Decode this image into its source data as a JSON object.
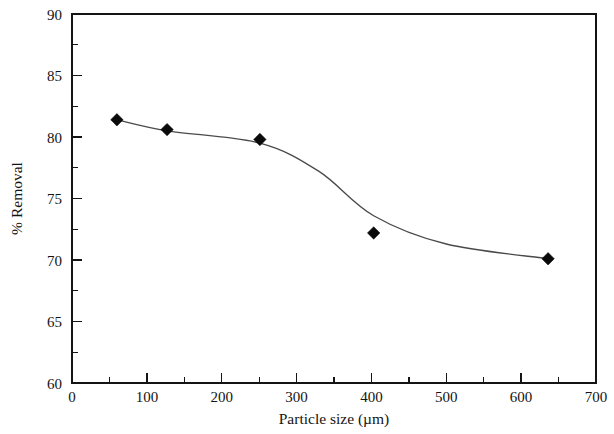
{
  "chart_data": {
    "type": "scatter",
    "title": "",
    "xlabel": "Particle size (µm)",
    "ylabel": "% Removal",
    "xlim": [
      0,
      700
    ],
    "ylim": [
      60,
      90
    ],
    "x_ticks": [
      0,
      100,
      200,
      300,
      400,
      500,
      600,
      700
    ],
    "x_tick_labels": [
      "0",
      "100",
      "200",
      "300",
      "400",
      "500",
      "600",
      "700"
    ],
    "x_minor_interval": 50,
    "y_ticks": [
      60,
      65,
      70,
      75,
      80,
      85,
      90
    ],
    "y_tick_labels": [
      "60",
      "65",
      "70",
      "75",
      "80",
      "85",
      "90"
    ],
    "y_minor_interval": 2.5,
    "grid": false,
    "legend": false,
    "legend_position": "none",
    "frame": "box",
    "marker_style": "filled-diamond",
    "marker_color": "#0a0a0a",
    "curve_color": "#4a4a4a",
    "series": [
      {
        "name": "% Removal vs particle size",
        "x": [
          60,
          127,
          251,
          403,
          636
        ],
        "values": [
          81.4,
          80.6,
          79.8,
          72.2,
          70.1
        ],
        "has_fit_curve": true,
        "fit_curve_x": [
          60,
          127,
          251,
          330,
          403,
          500,
          636
        ],
        "fit_curve_y": [
          81.4,
          80.5,
          79.5,
          77.2,
          73.6,
          71.3,
          70.1
        ]
      }
    ]
  },
  "axis_labels": {
    "x_title": "Particle size (µm)",
    "y_title": "% Removal"
  },
  "tick_text": {
    "x": [
      "0",
      "100",
      "200",
      "300",
      "400",
      "500",
      "600",
      "700"
    ],
    "y": [
      "90",
      "85",
      "80",
      "75",
      "70",
      "65",
      "60"
    ]
  },
  "colors": {
    "background": "#ffffff",
    "axis": "#141414",
    "marker": "#0a0a0a",
    "curve": "#4a4a4a"
  }
}
